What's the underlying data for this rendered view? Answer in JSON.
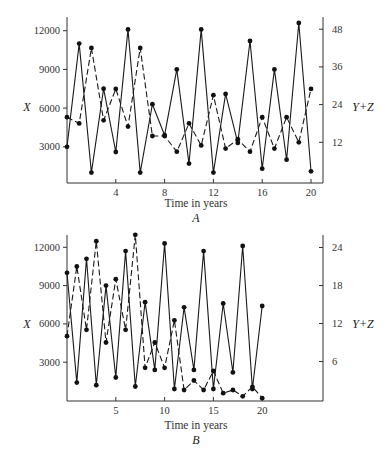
{
  "header": {
    "partial_text": ""
  },
  "chart_data": [
    {
      "panel": "A",
      "type": "line",
      "title": "",
      "xlabel": "Time in years",
      "panel_label": "A",
      "left_axis": {
        "label": "X",
        "ticks": [
          3000,
          6000,
          9000,
          12000
        ],
        "tick_labels": [
          "3000",
          "6000",
          "9000",
          "12000"
        ],
        "ylim": [
          0,
          13500
        ]
      },
      "right_axis": {
        "label": "Y+Z",
        "ticks": [
          12,
          24,
          36,
          48
        ],
        "tick_labels": [
          "12",
          "24",
          "36",
          "48"
        ],
        "ylim": [
          0,
          53
        ]
      },
      "x_ticks": [
        4,
        8,
        12,
        16,
        20
      ],
      "x_tick_labels": [
        "4",
        "8",
        "12",
        "16",
        "20"
      ],
      "xlim": [
        0,
        21.5
      ],
      "grid": false,
      "legend": "none",
      "x": [
        0,
        1,
        2,
        3,
        4,
        5,
        6,
        7,
        8,
        9,
        10,
        11,
        12,
        13,
        14,
        15,
        16,
        17,
        18,
        19,
        20
      ],
      "series": [
        {
          "name": "X",
          "axis": "left",
          "style": "solid",
          "values": [
            3000,
            11000,
            1000,
            7500,
            2600,
            12100,
            1000,
            6300,
            3900,
            9000,
            1700,
            12100,
            1000,
            7100,
            3300,
            11200,
            1300,
            9000,
            2000,
            12600,
            1100
          ]
        },
        {
          "name": "Y+Z",
          "axis": "right",
          "style": "dashed",
          "values": [
            20,
            18,
            42,
            19,
            29,
            17,
            42,
            14,
            14,
            9,
            18,
            11,
            27,
            10,
            13,
            9,
            20,
            10,
            20,
            12,
            29
          ]
        }
      ]
    },
    {
      "panel": "B",
      "type": "line",
      "title": "",
      "xlabel": "Time in years",
      "panel_label": "B",
      "left_axis": {
        "label": "X",
        "ticks": [
          3000,
          6000,
          9000,
          12000
        ],
        "tick_labels": [
          "3000",
          "6000",
          "9000",
          "12000"
        ],
        "ylim": [
          0,
          13000
        ]
      },
      "right_axis": {
        "label": "Y+Z",
        "ticks": [
          6,
          12,
          18,
          24
        ],
        "tick_labels": [
          "6",
          "12",
          "18",
          "24"
        ],
        "ylim": [
          0,
          26.5
        ]
      },
      "x_ticks": [
        5,
        10,
        15,
        20
      ],
      "x_tick_labels": [
        "5",
        "10",
        "15",
        "20"
      ],
      "xlim": [
        0,
        26.5
      ],
      "grid": false,
      "legend": "none",
      "x": [
        0,
        1,
        2,
        3,
        4,
        5,
        6,
        7,
        8,
        9,
        10,
        11,
        12,
        13,
        14,
        15,
        16,
        17,
        18,
        19,
        20
      ],
      "series": [
        {
          "name": "X",
          "axis": "left",
          "style": "solid",
          "values": [
            10000,
            1400,
            11100,
            1200,
            9000,
            1800,
            11700,
            1100,
            7700,
            2400,
            12300,
            900,
            7300,
            2400,
            11700,
            900,
            7600,
            2200,
            12100,
            900,
            7400
          ]
        },
        {
          "name": "Y+Z",
          "axis": "right",
          "style": "dashed",
          "values": [
            10,
            21,
            11,
            25,
            9,
            19,
            11,
            26,
            5,
            9,
            5,
            12.5,
            1.5,
            3,
            1.5,
            4.5,
            1,
            1.5,
            0.5,
            2,
            0.2
          ]
        }
      ]
    }
  ]
}
